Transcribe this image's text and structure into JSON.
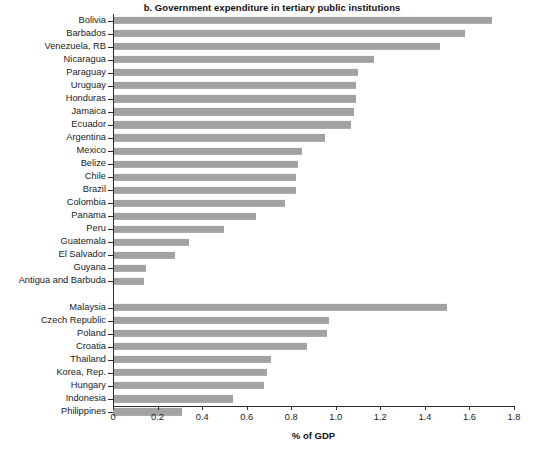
{
  "chart": {
    "title": "b. Government expenditure in tertiary public institutions",
    "xlabel": "% of GDP"
  },
  "axis": {
    "ticks": [
      "0",
      "0.2",
      "0.4",
      "0.6",
      "0.8",
      "1.0",
      "1.2",
      "1.4",
      "1.6",
      "1.8"
    ]
  },
  "colors": {
    "bar": "#a2a2a2",
    "axis": "#2b2b2b",
    "text": "#1a1a1a",
    "background": "#ffffff"
  },
  "chart_data": {
    "type": "bar",
    "orientation": "horizontal",
    "title": "b. Government expenditure in tertiary public institutions",
    "xlabel": "% of GDP",
    "ylabel": "",
    "xlim": [
      0,
      1.8
    ],
    "grid": false,
    "legend": null,
    "xticks": [
      0,
      0.2,
      0.4,
      0.6,
      0.8,
      1.0,
      1.2,
      1.4,
      1.6,
      1.8
    ],
    "groups": [
      {
        "name": "Latin America and the Caribbean",
        "categories": [
          "Bolivia",
          "Barbados",
          "Venezuela, RB",
          "Nicaragua",
          "Paraguay",
          "Uruguay",
          "Honduras",
          "Jamaica",
          "Ecuador",
          "Argentina",
          "Mexico",
          "Belize",
          "Chile",
          "Brazil",
          "Colombia",
          "Panama",
          "Peru",
          "Guatemala",
          "El Salvador",
          "Guyana",
          "Antigua and Barbuda"
        ],
        "values": [
          1.7,
          1.58,
          1.47,
          1.17,
          1.1,
          1.09,
          1.09,
          1.08,
          1.07,
          0.95,
          0.85,
          0.83,
          0.82,
          0.82,
          0.77,
          0.64,
          0.5,
          0.34,
          0.28,
          0.15,
          0.14
        ]
      },
      {
        "name": "Comparator countries",
        "categories": [
          "Malaysia",
          "Czech Republic",
          "Poland",
          "Croatia",
          "Thailand",
          "Korea, Rep.",
          "Hungary",
          "Indonesia",
          "Philippines"
        ],
        "values": [
          1.5,
          0.97,
          0.96,
          0.87,
          0.71,
          0.69,
          0.68,
          0.54,
          0.31
        ]
      }
    ]
  }
}
